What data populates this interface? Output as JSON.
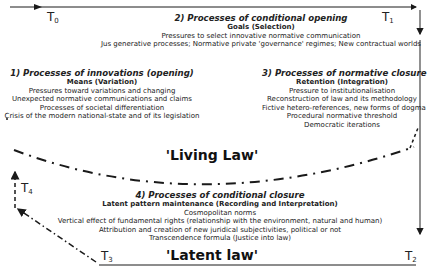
{
  "time_markers": {
    "t0": {
      "base": "T",
      "sub": "0"
    },
    "t1": {
      "base": "T",
      "sub": "1"
    },
    "t2": {
      "base": "T",
      "sub": "2"
    },
    "t3": {
      "base": "T",
      "sub": "3"
    },
    "t4": {
      "base": "T",
      "sub": "4"
    }
  },
  "block2": {
    "title": "2) Processes of conditional opening",
    "subtitle": "Goals (Selection)",
    "lines": [
      "Pressures to select innovative normative communication",
      "Jus generative processes; Normative private 'governance' regimes; New contractual worlds"
    ]
  },
  "block1": {
    "title": "1) Processes of innovations (opening)",
    "subtitle": "Means (Variation)",
    "lines": [
      "Pressures toward variations and changing",
      "Unexpected normative communications and claims",
      "Processes of societal differentiation",
      "Crisis of the modern national-state and of its legislation"
    ]
  },
  "block3": {
    "title": "3) Processes of normative closure",
    "subtitle": "Retention (Integration)",
    "lines": [
      "Pressure to institutionalisation",
      "Reconstruction of law and its methodology",
      "Fictive hetero-references, new forms of dogma",
      "Procedural normative threshold",
      "Democratic iterations"
    ]
  },
  "block4": {
    "title": "4) Processes of conditional closure",
    "subtitle": "Latent pattern maintenance (Recording and Interpretation)",
    "lines": [
      "Cosmopolitan norms",
      "Vertical effect of fundamental rights (relationship with the environment, natural and human)",
      "Attribution and creation of new juridical subjectivities, political or not",
      "Transcendence formula (Justice into law)"
    ]
  },
  "living_law": "'Living Law'",
  "latent_law": "'Latent law'",
  "colors": {
    "line": "#1a1a1a",
    "right_line": "#555555",
    "text": "#222222"
  }
}
